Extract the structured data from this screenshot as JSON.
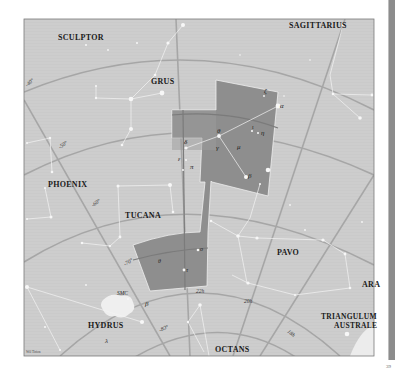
{
  "map": {
    "title": "Indus constellation chart",
    "constellations": [
      {
        "name": "SCULPTOR",
        "x": 58,
        "y": 40
      },
      {
        "name": "SAGITTARIUS",
        "x": 289,
        "y": 28
      },
      {
        "name": "GRUS",
        "x": 151,
        "y": 84
      },
      {
        "name": "PHOENIX",
        "x": 48,
        "y": 187
      },
      {
        "name": "TUCANA",
        "x": 125,
        "y": 218
      },
      {
        "name": "PAVO",
        "x": 277,
        "y": 255
      },
      {
        "name": "ARA",
        "x": 362,
        "y": 287
      },
      {
        "name": "TRIANGULUM",
        "x": 340,
        "y": 319
      },
      {
        "name": "AUSTRALE",
        "x": 335,
        "y": 329
      },
      {
        "name": "HYDRUS",
        "x": 88,
        "y": 328
      },
      {
        "name": "OCTANS",
        "x": 215,
        "y": 352
      }
    ],
    "highlighted_constellation_stars": [
      {
        "symbol": "ζ",
        "x": 264,
        "y": 93
      },
      {
        "symbol": "α",
        "x": 278,
        "y": 106
      },
      {
        "symbol": "θ",
        "x": 219,
        "y": 135
      },
      {
        "symbol": "ι",
        "x": 252,
        "y": 130
      },
      {
        "symbol": "η",
        "x": 261,
        "y": 135
      },
      {
        "symbol": "δ",
        "x": 186,
        "y": 143
      },
      {
        "symbol": "γ",
        "x": 217,
        "y": 150
      },
      {
        "symbol": "μ",
        "x": 238,
        "y": 148
      },
      {
        "symbol": "ε",
        "x": 178,
        "y": 160
      },
      {
        "symbol": "π",
        "x": 190,
        "y": 168
      },
      {
        "symbol": "β",
        "x": 246,
        "y": 177
      }
    ],
    "other_star_labels": [
      {
        "symbol": "o",
        "x": 200,
        "y": 250
      },
      {
        "symbol": "θ",
        "x": 160,
        "y": 262
      },
      {
        "symbol": "τ",
        "x": 183,
        "y": 272
      },
      {
        "symbol": "SMC",
        "x": 117,
        "y": 295
      },
      {
        "symbol": "β",
        "x": 146,
        "y": 305
      },
      {
        "symbol": "λ",
        "x": 105,
        "y": 342
      }
    ],
    "declination_labels": [
      {
        "text": "-40°",
        "x": 27,
        "y": 85,
        "rot": -40
      },
      {
        "text": "-50°",
        "x": 60,
        "y": 148,
        "rot": -35
      },
      {
        "text": "-60°",
        "x": 94,
        "y": 206,
        "rot": -35
      },
      {
        "text": "-70°",
        "x": 126,
        "y": 264,
        "rot": -30
      },
      {
        "text": "-80°",
        "x": 160,
        "y": 330,
        "rot": -25
      }
    ],
    "ra_labels": [
      {
        "text": "22h",
        "x": 196,
        "y": 293
      },
      {
        "text": "20h",
        "x": 244,
        "y": 302
      },
      {
        "text": "18h",
        "x": 286,
        "y": 333
      }
    ],
    "credit": "Wil Tirion",
    "page_number": "39"
  },
  "colors": {
    "sky": "#cfcfcf",
    "highlight": "#8f8f8f",
    "highlight_light": "#b2b2b2",
    "grid": "#9a9a9a",
    "lines": "#f2f2f2",
    "frame": "#7a7a7a",
    "side_bar": "#8a8a8a"
  }
}
